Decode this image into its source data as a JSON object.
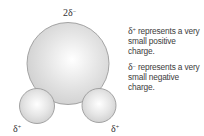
{
  "diagram": {
    "oxygen_atom": {
      "label_coefficient": "2",
      "label_symbol": "δ",
      "label_charge": "−"
    },
    "hydrogen_left": {
      "label_symbol": "δ",
      "label_charge": "+"
    },
    "hydrogen_right": {
      "label_symbol": "δ",
      "label_charge": "+"
    },
    "colors": {
      "atom_fill": "#d6d6d6",
      "atom_highlight": "#ffffff",
      "atom_outline": "#9b9b9b"
    }
  },
  "legend": {
    "positive": {
      "symbol": "δ",
      "charge": "+",
      "text": "represents a very small positive charge."
    },
    "negative": {
      "symbol": "δ",
      "charge": "−",
      "text": "represents a very small negative charge."
    }
  }
}
